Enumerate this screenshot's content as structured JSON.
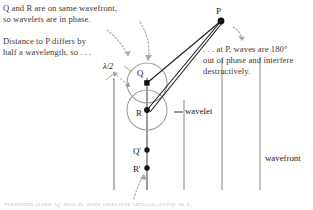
{
  "figure": {
    "background": "#ffffff",
    "width": 313,
    "height": 210
  },
  "annotations": {
    "top_left_1": "Q and R are on same wavefront,\nso wavelets are in phase.",
    "top_left_2": "Distance to P differs by\nhalf a wavelength, so . . .",
    "top_right": ". . . at P, waves are 180°\nout of phase and interfere\ndestructively.",
    "clipped_bottom": "Wavelets from Q' and R' also interfere destructively at P."
  },
  "labels": {
    "point_P": "P",
    "point_Q": "Q",
    "point_R": "R",
    "point_Q_prime": "Q'",
    "point_R_prime": "R'",
    "half_wavelength": "λ/2",
    "wavelet": "wavelet",
    "wavefront": "wavefront"
  },
  "geometry": {
    "point_P": {
      "x": 221,
      "y": 21
    },
    "point_Q": {
      "x": 147,
      "y": 83
    },
    "point_R": {
      "x": 147,
      "y": 110
    },
    "point_Q_prime": {
      "x": 147,
      "y": 150
    },
    "point_R_prime": {
      "x": 147,
      "y": 168
    },
    "wavelet_radius": 20,
    "wavefront_x_positions": [
      114,
      147,
      184,
      222,
      260
    ],
    "wavefront_y_top": 78,
    "wavefront_y_bottom": 190
  },
  "colors": {
    "ray": "#1d1d1d",
    "wavefront_line": "#8a8a86",
    "wavelet_arc": "#9b9b97",
    "dotted_arrow": "#a9a9a4",
    "text": "#3a3a36",
    "point_fill": "#111111"
  }
}
